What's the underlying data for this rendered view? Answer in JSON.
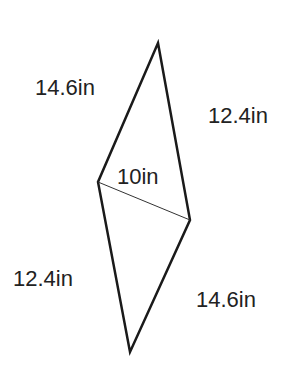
{
  "diagram": {
    "type": "quadrilateral-with-diagonal",
    "stroke_color": "#1a1a1a",
    "vertices": {
      "top": [
        158,
        43
      ],
      "left": [
        98,
        182
      ],
      "right": [
        190,
        220
      ],
      "bottom": [
        130,
        352
      ]
    },
    "labels": {
      "top_left_side": "14.6in",
      "top_right_side": "12.4in",
      "diagonal": "10in",
      "bottom_left_side": "12.4in",
      "bottom_right_side": "14.6in"
    }
  }
}
